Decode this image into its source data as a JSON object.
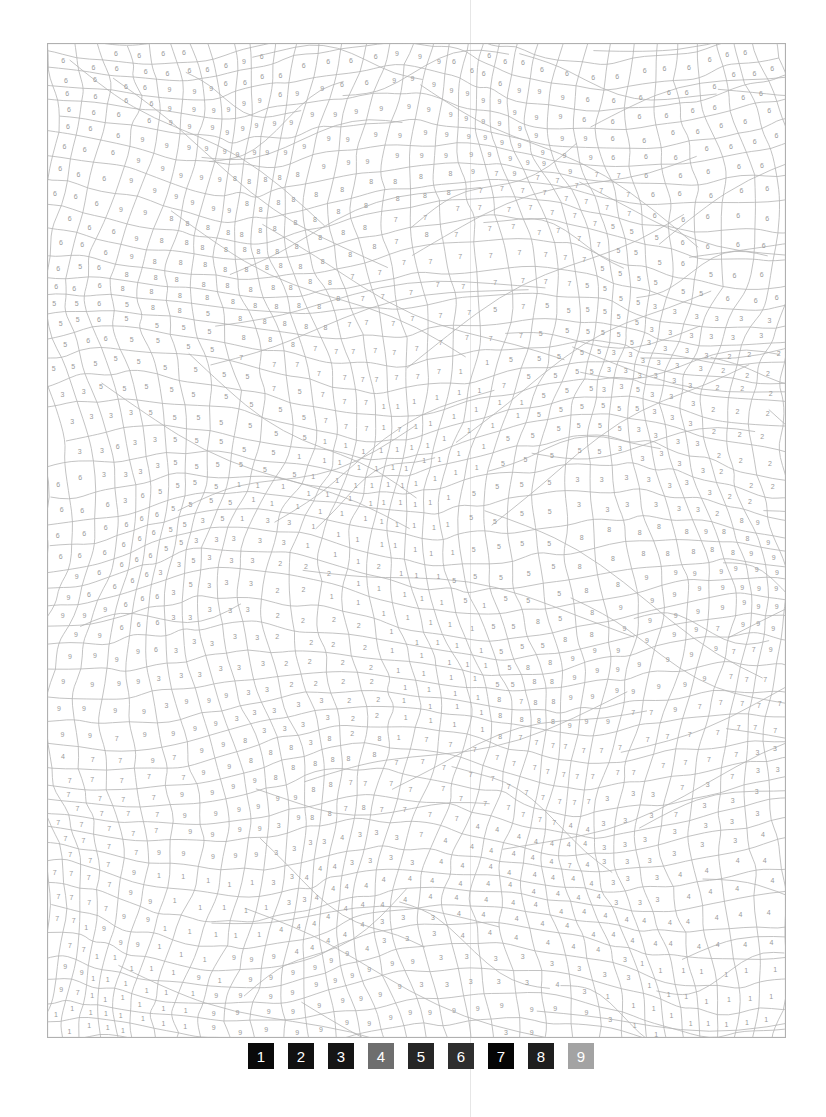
{
  "page": {
    "type": "color-by-number"
  },
  "palette": [
    {
      "number": "1",
      "color": "#0a0a0a"
    },
    {
      "number": "2",
      "color": "#111111"
    },
    {
      "number": "3",
      "color": "#151515"
    },
    {
      "number": "4",
      "color": "#6e6e6e"
    },
    {
      "number": "5",
      "color": "#262626"
    },
    {
      "number": "6",
      "color": "#2e2e2e"
    },
    {
      "number": "7",
      "color": "#050505"
    },
    {
      "number": "8",
      "color": "#1e1e1e"
    },
    {
      "number": "9",
      "color": "#a3a3a3"
    }
  ],
  "artwork": {
    "line_color": "#b4b4b4",
    "digit_color": "#9a9a9a",
    "border_color": "#b0b0b0",
    "region_map_rows": [
      "66666666699666666666",
      "66699999999999666666",
      "66999999999999966666",
      "66999888888777776666",
      "66988888877777755666",
      "66888888777777555566",
      "56555888777775553333",
      "55555777777155533322",
      "33355557711115553322",
      "33355551111155533322",
      "66655111111555333322",
      "66653331111555888889",
      "96633322111555889999",
      "99633322211155899999",
      "99933322211158999977",
      "99999333211188999777",
      "47779888877777777773",
      "77799998777777733333",
      "77799933334444433344",
      "77911134444444433444",
      "79911144433444444444",
      "91111999993333331111",
      "11119999999999911111"
    ]
  }
}
